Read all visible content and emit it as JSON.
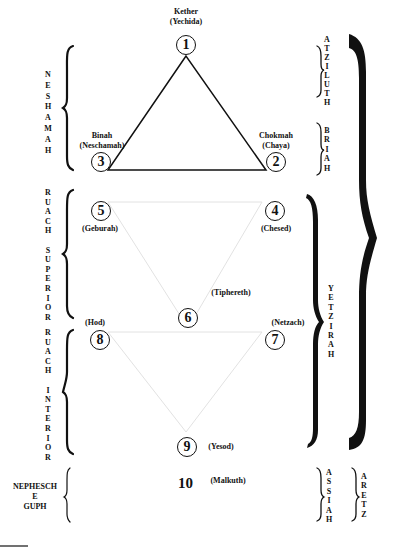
{
  "diagram": {
    "sephiroth": [
      {
        "number": "1",
        "name": "Kether",
        "soul": "(Yechida)"
      },
      {
        "number": "2",
        "name": "Chokmah",
        "soul": "(Chaya)"
      },
      {
        "number": "3",
        "name": "Binah",
        "soul": "(Neschamah)"
      },
      {
        "number": "4",
        "name": "(Chesed)"
      },
      {
        "number": "5",
        "name": "(Geburah)"
      },
      {
        "number": "6",
        "name": "(Tiphereth)"
      },
      {
        "number": "7",
        "name": "(Netzach)"
      },
      {
        "number": "8",
        "name": "(Hod)"
      },
      {
        "number": "9",
        "name": "(Yesod)"
      },
      {
        "number": "10",
        "name": "(Malkuth)"
      }
    ],
    "left_groups": {
      "neshamah": "N\nE\nS\nH\nA\nM\nA\nH",
      "ruach_superior": "R\nU\nA\nC\nH\n\nS\nU\nP\nE\nR\nI\nO\nR",
      "ruach_interior": "R\nU\nA\nC\nH\n\nI\nN\nT\nE\nR\nI\nO\nR",
      "nephesch_line1": "NEPHESCH",
      "nephesch_line2": "E",
      "nephesch_line3": "GUPH"
    },
    "right_worlds": {
      "atziluth": "A\nT\nZ\nI\nL\nU\nT\nH",
      "briah": "B\nR\nI\nA\nH",
      "yetzirah": "Y\nE\nT\nZ\nI\nR\nA\nH",
      "assiah": "A\nS\nS\nI\nA\nH",
      "aretz": "A\nR\nE\nT\nZ"
    },
    "colors": {
      "ink": "#111111",
      "faint_line": "#e4e4e4",
      "background": "#ffffff"
    }
  }
}
